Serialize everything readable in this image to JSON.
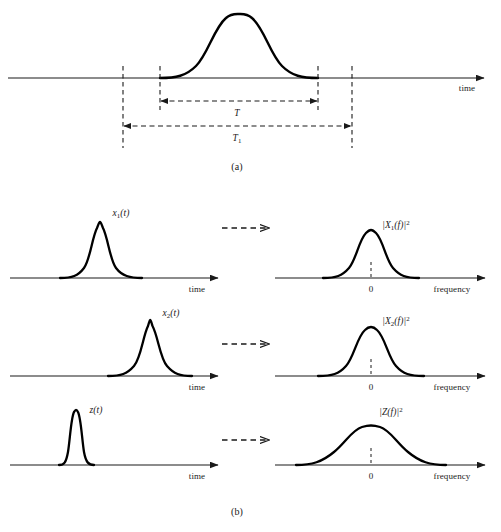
{
  "figure": {
    "width": 501,
    "height": 532,
    "background": "#ffffff",
    "stroke_color": "#1a1a1a",
    "curve_color": "#000000"
  },
  "panel_a": {
    "caption": "(a)",
    "axis_label": "time",
    "axis": {
      "y": 78,
      "x_start": 8,
      "x_end": 488
    },
    "pulse": {
      "x_start": 160,
      "x_end": 318,
      "peak_x": 239,
      "peak_y": 14
    },
    "guides": [
      {
        "name": "t1-left",
        "x": 123,
        "y_top": 66,
        "y_bottom": 148
      },
      {
        "name": "t-left",
        "x": 160,
        "y_top": 66,
        "y_bottom": 110
      },
      {
        "name": "t-right",
        "x": 318,
        "y_top": 66,
        "y_bottom": 110
      },
      {
        "name": "t1-right",
        "x": 352,
        "y_top": 66,
        "y_bottom": 148
      }
    ],
    "measures": [
      {
        "label": "T",
        "sub": "",
        "x_start": 160,
        "x_end": 318,
        "y": 101,
        "label_x": 237,
        "label_y": 114
      },
      {
        "label": "T",
        "sub": "1",
        "x_start": 123,
        "x_end": 352,
        "y": 126,
        "label_x": 237,
        "label_y": 139
      }
    ]
  },
  "panel_b": {
    "caption": "(b)",
    "time_axis_label": "time",
    "frequency_axis_label": "frequency",
    "zero_tick_label": "0",
    "rows": [
      {
        "name": "row-x1",
        "axis_y": 278,
        "arrow": {
          "x_start": 222,
          "x_end": 273,
          "y": 228
        },
        "time": {
          "label": "x",
          "label_sub": "1",
          "label_tail": "(t)",
          "label_x": 121,
          "label_y": 214,
          "axis_x_start": 10,
          "axis_x_end": 222,
          "pulse_start": 60,
          "pulse_end": 142,
          "peak_x": 100,
          "peak_y": 222
        },
        "freq": {
          "label": "|X",
          "label_sub": "1",
          "label_tail": "(f)|",
          "label_sup": "2",
          "label_x": 396,
          "label_y": 226,
          "axis_x_start": 275,
          "axis_x_end": 489,
          "pulse_start": 323,
          "pulse_end": 419,
          "peak_x": 371,
          "peak_y": 230,
          "zero_x": 371
        }
      },
      {
        "name": "row-x2",
        "axis_y": 376,
        "arrow": {
          "x_start": 222,
          "x_end": 273,
          "y": 344
        },
        "time": {
          "label": "x",
          "label_sub": "2",
          "label_tail": "(t)",
          "label_x": 171,
          "label_y": 314,
          "axis_x_start": 10,
          "axis_x_end": 222,
          "pulse_start": 108,
          "pulse_end": 192,
          "peak_x": 150,
          "peak_y": 320,
          "zero_x": null
        },
        "freq": {
          "label": "|X",
          "label_sub": "2",
          "label_tail": "(f)|",
          "label_sup": "2",
          "label_x": 396,
          "label_y": 322,
          "axis_x_start": 275,
          "axis_x_end": 489,
          "pulse_start": 318,
          "pulse_end": 424,
          "peak_x": 371,
          "peak_y": 327,
          "zero_x": 371
        }
      },
      {
        "name": "row-z",
        "axis_y": 465,
        "arrow": {
          "x_start": 222,
          "x_end": 273,
          "y": 440
        },
        "time": {
          "label": "z",
          "label_sub": "",
          "label_tail": "(t)",
          "label_x": 96,
          "label_y": 411,
          "axis_x_start": 10,
          "axis_x_end": 222,
          "pulse_start": 59,
          "pulse_end": 94,
          "peak_x": 76,
          "peak_y": 410
        },
        "freq": {
          "label": "|Z",
          "label_sub": "",
          "label_tail": "(f)|",
          "label_sup": "2",
          "label_x": 391,
          "label_y": 413,
          "axis_x_start": 275,
          "axis_x_end": 489,
          "pulse_start": 296,
          "pulse_end": 446,
          "peak_x": 371,
          "peak_y": 426,
          "zero_x": 371
        }
      }
    ],
    "caption_x": 237,
    "caption_y": 512
  }
}
